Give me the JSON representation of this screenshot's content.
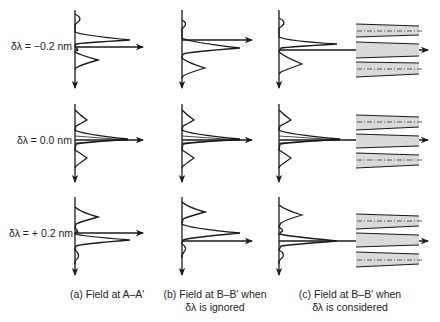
{
  "rows": [
    {
      "label": "δλ = −0.2 nm"
    },
    {
      "label": "δλ = 0.0 nm"
    },
    {
      "label": "δλ = + 0.2 nm"
    }
  ],
  "captions": {
    "a": {
      "line1": "(a) Field at A–A′",
      "line2": ""
    },
    "b": {
      "line1": "(b) Field at B–B′ when",
      "line2": "δλ is ignored"
    },
    "c": {
      "line1": "(c) Field at B–B′ when",
      "line2": "δλ is considered"
    }
  },
  "colors": {
    "line": "#1a1a1a",
    "waveguide_fill": "#d9d9d9"
  }
}
